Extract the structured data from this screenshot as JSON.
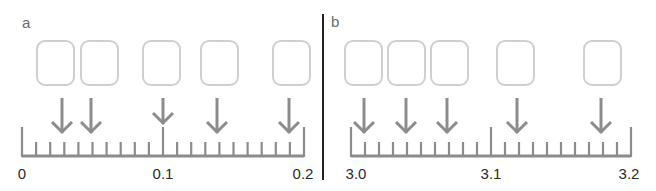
{
  "colors": {
    "box_stroke": "#cfcfcf",
    "ruler": "#8c8c8c",
    "arrow": "#8c8c8c",
    "divider": "#222222",
    "label_text": "#2a2a2a",
    "panel_letter": "#6a6a6a"
  },
  "panels": [
    {
      "letter": "a",
      "ruler": {
        "min": 0,
        "max": 0.2,
        "minor_step": 0.01,
        "major_step": 0.1,
        "labels": [
          "0",
          "0.1",
          "0.2"
        ]
      },
      "boxes_count": 5,
      "arrow_positions": [
        0.03,
        0.05,
        0.1,
        0.14,
        0.19
      ]
    },
    {
      "letter": "b",
      "ruler": {
        "min": 3.0,
        "max": 3.2,
        "minor_step": 0.01,
        "major_step": 0.1,
        "labels": [
          "3.0",
          "3.1",
          "3.2"
        ]
      },
      "boxes_count": 5,
      "arrow_positions": [
        3.01,
        3.04,
        3.07,
        3.12,
        3.18
      ]
    }
  ],
  "layout": {
    "a": {
      "ruler_x0": 22,
      "ruler_x1": 304,
      "box_lefts": [
        37,
        81,
        143,
        201,
        273
      ],
      "arrow_xs": [
        62,
        91,
        163,
        217,
        289
      ]
    },
    "b": {
      "ruler_x0": 351,
      "ruler_x1": 631,
      "box_lefts": [
        345,
        388,
        431,
        497,
        584
      ],
      "arrow_xs": [
        364,
        406,
        447,
        517,
        601
      ]
    }
  }
}
